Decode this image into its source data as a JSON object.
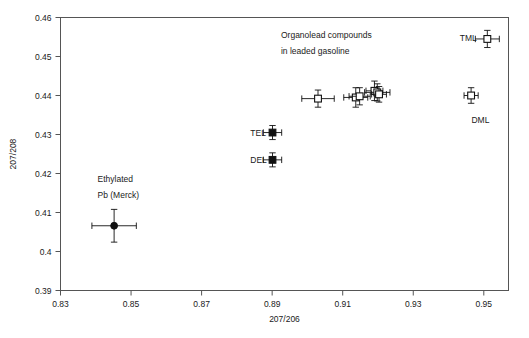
{
  "chart_data": {
    "type": "scatter",
    "title": "",
    "xlabel": "207/206",
    "ylabel": "207/208",
    "xlim": [
      0.83,
      0.957
    ],
    "ylim": [
      0.39,
      0.46
    ],
    "xticks": [
      0.83,
      0.85,
      0.87,
      0.89,
      0.91,
      0.93,
      0.95
    ],
    "xticklabels": [
      "0.83",
      "0.85",
      "0.87",
      "0.89",
      "0.91",
      "0.93",
      "0.95"
    ],
    "yticks": [
      0.39,
      0.4,
      0.41,
      0.42,
      0.43,
      0.44,
      0.45,
      0.46
    ],
    "yticklabels": [
      "0.39",
      "0.4",
      "0.41",
      "0.42",
      "0.43",
      "0.44",
      "0.45",
      "0.46"
    ],
    "grid": false,
    "legend_position": "none",
    "annotations": [
      {
        "name": "organolead-note-line1",
        "text": "Organolead compounds",
        "x": 0.8925,
        "y": 0.4555
      },
      {
        "name": "organolead-note-line2",
        "text": "in leaded gasoline",
        "x": 0.8925,
        "y": 0.4513
      },
      {
        "name": "ethylated-note-line1",
        "text": "Ethylated",
        "x": 0.8405,
        "y": 0.4187
      },
      {
        "name": "ethylated-note-line2",
        "text": "Pb (Merck)",
        "x": 0.8405,
        "y": 0.4145
      },
      {
        "name": "tel-label",
        "text": "TEL",
        "x": 0.8838,
        "y": 0.4305
      },
      {
        "name": "del-label",
        "text": "DEL",
        "x": 0.8838,
        "y": 0.4235
      },
      {
        "name": "tml-label",
        "text": "TML",
        "x": 0.9432,
        "y": 0.4548
      },
      {
        "name": "dml-label",
        "text": "DML",
        "x": 0.9465,
        "y": 0.4338
      }
    ],
    "series": [
      {
        "name": "Ethylated Pb (Merck)",
        "marker": "filled-circle",
        "points": [
          {
            "label": "Ethylated Pb (Merck)",
            "x": 0.8452,
            "y": 0.4066,
            "xerr": 0.0063,
            "yerr": 0.0042
          }
        ]
      },
      {
        "name": "Tetraethyl lead (TEL)",
        "marker": "filled-square",
        "points": [
          {
            "label": "TEL",
            "x": 0.8901,
            "y": 0.4305,
            "xerr": 0.0026,
            "yerr": 0.0018
          }
        ]
      },
      {
        "name": "Diethyl lead (DEL)",
        "marker": "filled-square",
        "points": [
          {
            "label": "DEL",
            "x": 0.8901,
            "y": 0.4235,
            "xerr": 0.0026,
            "yerr": 0.0018
          }
        ]
      },
      {
        "name": "Tetramethyl lead (TML)",
        "marker": "open-square",
        "points": [
          {
            "label": "TML",
            "x": 0.951,
            "y": 0.4545,
            "xerr": 0.0034,
            "yerr": 0.0022
          }
        ]
      },
      {
        "name": "Dimethyl lead (DML)",
        "marker": "open-square",
        "points": [
          {
            "label": "DML",
            "x": 0.9464,
            "y": 0.44,
            "xerr": 0.002,
            "yerr": 0.002
          }
        ]
      },
      {
        "name": "Organolead compounds in leaded gasoline",
        "marker": "open-square",
        "points": [
          {
            "label": "gasoline-1",
            "x": 0.903,
            "y": 0.4392,
            "xerr": 0.0046,
            "yerr": 0.0022
          },
          {
            "label": "gasoline-2",
            "x": 0.9137,
            "y": 0.4395,
            "xerr": 0.0034,
            "yerr": 0.0025
          },
          {
            "label": "gasoline-3",
            "x": 0.9148,
            "y": 0.4398,
            "xerr": 0.003,
            "yerr": 0.0022
          },
          {
            "label": "gasoline-4",
            "x": 0.919,
            "y": 0.4412,
            "xerr": 0.0024,
            "yerr": 0.0025
          },
          {
            "label": "gasoline-5",
            "x": 0.9198,
            "y": 0.4408,
            "xerr": 0.0036,
            "yerr": 0.0022
          },
          {
            "label": "gasoline-6",
            "x": 0.9203,
            "y": 0.4403,
            "xerr": 0.0021,
            "yerr": 0.002
          }
        ]
      }
    ]
  }
}
